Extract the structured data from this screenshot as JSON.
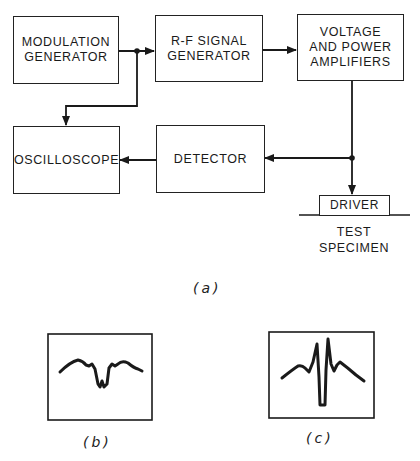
{
  "diagram": {
    "blocks": {
      "modulation_generator": {
        "line1": "MODULATION",
        "line2": "GENERATOR"
      },
      "rf_signal_generator": {
        "line1": "R-F SIGNAL",
        "line2": "GENERATOR"
      },
      "amplifiers": {
        "line1": "VOLTAGE",
        "line2": "AND POWER",
        "line3": "AMPLIFIERS"
      },
      "oscilloscope": {
        "line1": "OSCILLOSCOPE"
      },
      "detector": {
        "line1": "DETECTOR"
      },
      "driver": {
        "line1": "DRIVER"
      }
    },
    "test_specimen": {
      "line1": "TEST",
      "line2": "SPECIMEN"
    },
    "connections": [
      {
        "from": "MODULATION GENERATOR",
        "to": "R-F SIGNAL GENERATOR"
      },
      {
        "from": "MODULATION GENERATOR",
        "to": "OSCILLOSCOPE"
      },
      {
        "from": "R-F SIGNAL GENERATOR",
        "to": "VOLTAGE AND POWER AMPLIFIERS"
      },
      {
        "from": "VOLTAGE AND POWER AMPLIFIERS",
        "to": "DRIVER"
      },
      {
        "from": "VOLTAGE AND POWER AMPLIFIERS",
        "to": "DETECTOR"
      },
      {
        "from": "DETECTOR",
        "to": "OSCILLOSCOPE"
      }
    ],
    "captions": {
      "a": "(a)",
      "b": "(b)",
      "c": "(c)"
    },
    "waveforms": {
      "b": {
        "description": "oscilloscope trace with broad central notch (double-dip)"
      },
      "c": {
        "description": "oscilloscope trace with two sharp peaks around a deep central trough"
      }
    },
    "colors": {
      "ink": "#1a1a1a",
      "background": "#ffffff"
    }
  }
}
